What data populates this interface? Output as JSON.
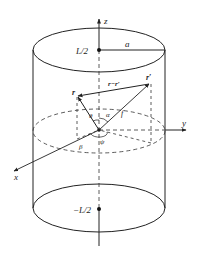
{
  "figure": {
    "labels": {
      "z_axis": "z",
      "y_axis": "y",
      "x_axis": "x",
      "top_point": "L/2",
      "bottom_point": "−L/2",
      "radius": "a",
      "vector_r": "r",
      "vector_r_prime": "r′",
      "difference_vector": "r−r′",
      "angle_alpha": "α",
      "angle_theta": "θ",
      "angle_beta": "β",
      "angle_psi": "ψ",
      "length_f": "f"
    },
    "colors": {
      "stroke": "#222222",
      "background": "#ffffff"
    }
  }
}
